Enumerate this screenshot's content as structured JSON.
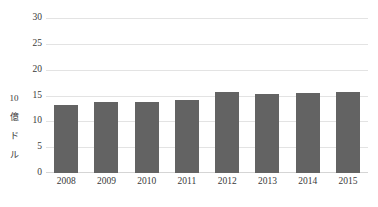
{
  "chart_data": {
    "type": "bar",
    "title": "",
    "subtitle": "",
    "xlabel": "",
    "ylabel": "10億ドル",
    "ylabel_chars": [
      "10",
      "億",
      "ド",
      "ル"
    ],
    "categories": [
      "2008",
      "2009",
      "2010",
      "2011",
      "2012",
      "2013",
      "2014",
      "2015"
    ],
    "values": [
      13.2,
      13.8,
      13.8,
      14.1,
      15.7,
      15.2,
      15.4,
      15.7
    ],
    "series": [
      {
        "name": "",
        "values": [
          13.2,
          13.8,
          13.8,
          14.1,
          15.7,
          15.2,
          15.4,
          15.7
        ]
      }
    ],
    "ylim": [
      0,
      30
    ],
    "yticks": [
      "0",
      "5",
      "10",
      "15",
      "20",
      "25",
      "30"
    ],
    "ytick_values": [
      0,
      5,
      10,
      15,
      20,
      25,
      30
    ],
    "grid": true,
    "grid_axis": "y",
    "legend": false,
    "legend_position": "none",
    "bar_color": "#636363",
    "grid_color": "#e3e3e3",
    "background_color": "#ffffff",
    "text_color": "#3a3a3a"
  }
}
